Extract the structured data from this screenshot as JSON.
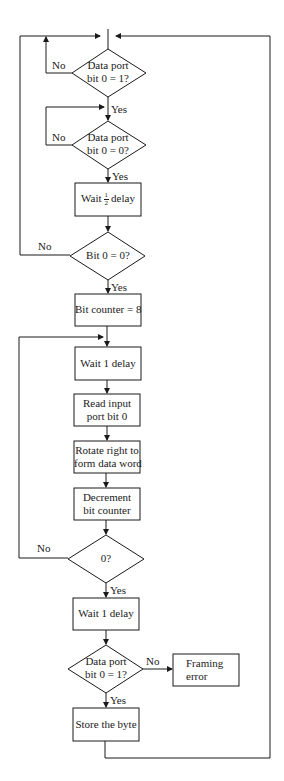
{
  "flowchart": {
    "decision1": {
      "line1": "Data port",
      "line2": "bit 0 = 1?",
      "yes": "Yes",
      "no": "No"
    },
    "decision2": {
      "line1": "Data port",
      "line2": "bit 0 = 0?",
      "yes": "Yes",
      "no": "No"
    },
    "wait_half": {
      "prefix": "Wait",
      "frac_num": "1",
      "frac_den": "2",
      "suffix": "delay"
    },
    "decision3": {
      "label": "Bit 0 = 0?",
      "yes": "Yes",
      "no": "No"
    },
    "bit_counter": {
      "label": "Bit counter = 8"
    },
    "wait_one_a": {
      "label": "Wait 1 delay"
    },
    "read_input": {
      "line1": "Read input",
      "line2": "port bit 0"
    },
    "rotate": {
      "line1": "Rotate right to",
      "line2": "form data word"
    },
    "decrement": {
      "line1": "Decrement",
      "line2": "bit counter"
    },
    "decision4": {
      "label": "0?",
      "yes": "Yes",
      "no": "No"
    },
    "wait_one_b": {
      "label": "Wait 1 delay"
    },
    "decision5": {
      "line1": "Data port",
      "line2": "bit 0 = 1?",
      "yes": "Yes",
      "no": "No"
    },
    "framing_error": {
      "line1": "Framing",
      "line2": "error"
    },
    "store_byte": {
      "label": "Store the byte"
    }
  },
  "colors": {
    "line": "#1a1a1a",
    "background": "#ffffff"
  }
}
